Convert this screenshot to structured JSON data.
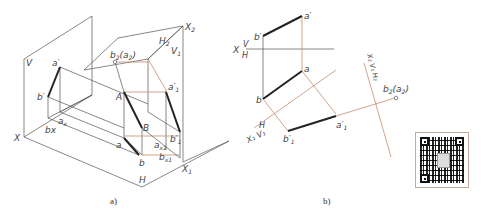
{
  "figure_a": {
    "caption": "a)",
    "labels": {
      "V": "V",
      "X": "X",
      "H": "H",
      "a_prime": "a′",
      "b_prime": "b′",
      "a_x": "a",
      "a_x_sub": "x",
      "b_x": "bx",
      "A": "A",
      "B": "B",
      "a": "a",
      "b": "b",
      "a_x1": "a",
      "a_x1_sub": "x1",
      "b_x1": "b",
      "b_x1_sub": "x1",
      "a1_prime": "a′",
      "a1_prime_sub": "1",
      "b1_prime": "b′",
      "b1_prime_sub": "1",
      "b2a2": "b",
      "b2a2_sub": "2",
      "b2a2_paren": "(a",
      "b2a2_paren_sub": "2",
      "b2a2_close": ")",
      "H2": "H",
      "H2_sub": "2",
      "V1": "V",
      "V1_sub": "1",
      "X1": "X",
      "X1_sub": "1",
      "X2": "X",
      "X2_sub": "2"
    }
  },
  "figure_b": {
    "caption": "b)",
    "labels": {
      "X": "X",
      "V": "V",
      "H": "H",
      "a_prime": "a′",
      "b_prime": "b′",
      "a": "a",
      "b": "b",
      "H_axis": "H",
      "X1V1": "X₁ V₁",
      "a1_prime": "a′",
      "a1_prime_sub": "1",
      "b1_prime": "b′",
      "b1_prime_sub": "1",
      "b2a2": "b",
      "b2a2_sub": "2",
      "b2a2_paren": "(a",
      "b2a2_paren_sub": "2",
      "b2a2_close": ")",
      "X2_axis_label": "X₂ V₁ H₂"
    }
  },
  "colors": {
    "construction_line": "#c98a70",
    "object_line": "#222222",
    "frame_line": "#555555"
  },
  "qr_code": {
    "icon": "qr-code-icon"
  }
}
